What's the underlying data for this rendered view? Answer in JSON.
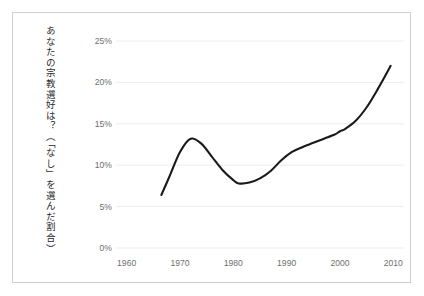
{
  "figure": {
    "background": "#ffffff",
    "frame_color": "#cfcfcf",
    "gridline_color": "#ececed",
    "line_color": "#1a1a1a",
    "tick_text_color": "#6e6e6e",
    "axis_label_color": "#2b2b2b"
  },
  "chart_data": {
    "type": "line",
    "title": "",
    "subtitle": "",
    "xlabel": "",
    "ylabel": "あなたの宗教選好は？（「なし」を選んだ割合）",
    "xlim": [
      1958,
      2012
    ],
    "ylim": [
      0,
      25
    ],
    "grid": true,
    "grid_axis": "y",
    "legend": false,
    "legend_position": "none",
    "ytick_labels": [
      "0%",
      "5%",
      "10%",
      "15%",
      "20%",
      "25%"
    ],
    "ytick_values": [
      0,
      5,
      10,
      15,
      20,
      25
    ],
    "xtick_labels": [
      "1960",
      "1970",
      "1980",
      "1990",
      "2000",
      "2010"
    ],
    "xtick_values": [
      1960,
      1970,
      1980,
      1990,
      2000,
      2010
    ],
    "series": [
      {
        "name": "宗教選好なし",
        "x": [
          1966.5,
          1968,
          1970,
          1972,
          1974,
          1976,
          1978,
          1980,
          1981,
          1983,
          1985,
          1987,
          1989,
          1991,
          1993,
          1995,
          1997,
          1999,
          2000,
          2001,
          2003,
          2005,
          2007,
          2009.5
        ],
        "values": [
          6.4,
          8.6,
          11.6,
          13.2,
          12.6,
          11.0,
          9.4,
          8.2,
          7.8,
          7.9,
          8.4,
          9.3,
          10.6,
          11.6,
          12.2,
          12.7,
          13.2,
          13.7,
          14.1,
          14.4,
          15.4,
          17.0,
          19.1,
          22.0
        ]
      }
    ]
  }
}
